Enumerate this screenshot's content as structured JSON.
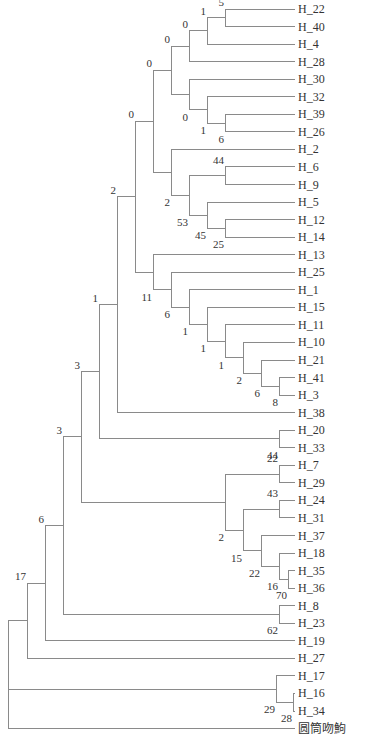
{
  "figure": {
    "type": "phylogenetic-tree",
    "layout": "rectangular-cladogram",
    "colors": {
      "branch": "#8a8a8a",
      "text": "#333333",
      "background": "#ffffff"
    },
    "geometry": {
      "leaf_x": 295,
      "label_x": 298,
      "first_leaf_y": 9,
      "leaf_spacing": 17.55
    }
  },
  "leaves": [
    "H_22",
    "H_40",
    "H_4",
    "H_28",
    "H_30",
    "H_32",
    "H_39",
    "H_26",
    "H_2",
    "H_6",
    "H_9",
    "H_5",
    "H_12",
    "H_14",
    "H_13",
    "H_25",
    "H_1",
    "H_15",
    "H_11",
    "H_10",
    "H_21",
    "H_41",
    "H_3",
    "H_38",
    "H_20",
    "H_33",
    "H_7",
    "H_29",
    "H_24",
    "H_31",
    "H_37",
    "H_18",
    "H_35",
    "H_36",
    "H_8",
    "H_23",
    "H_19",
    "H_27",
    "H_17",
    "H_16",
    "H_34",
    "圆筒吻鮈"
  ],
  "tree": {
    "x": 8,
    "support": "",
    "children": [
      {
        "x": 27,
        "support": "17",
        "children": [
          {
            "x": 45,
            "support": "6",
            "children": [
              {
                "x": 63,
                "support": "3",
                "children": [
                  {
                    "x": 81,
                    "support": "3",
                    "children": [
                      {
                        "x": 99,
                        "support": "1",
                        "children": [
                          {
                            "x": 117,
                            "support": "2",
                            "children": [
                              {
                                "x": 135,
                                "support": "0",
                                "children": [
                                  {
                                    "x": 153,
                                    "support": "0",
                                    "children": [
                                      {
                                        "x": 171,
                                        "support": "0",
                                        "children": [
                                          {
                                            "x": 189,
                                            "support": "0",
                                            "children": [
                                              {
                                                "x": 207,
                                                "support": "1",
                                                "children": [
                                                  {
                                                    "x": 225,
                                                    "support": "5",
                                                    "children": [
                                                      {
                                                        "leaf": "H_22"
                                                      },
                                                      {
                                                        "leaf": "H_40"
                                                      }
                                                    ]
                                                  },
                                                  {
                                                    "leaf": "H_4"
                                                  }
                                                ]
                                              },
                                              {
                                                "leaf": "H_28"
                                              }
                                            ]
                                          },
                                          {
                                            "x": 189,
                                            "support": "0",
                                            "label_below": true,
                                            "children": [
                                              {
                                                "leaf": "H_30"
                                              },
                                              {
                                                "x": 207,
                                                "support": "1",
                                                "label_below": true,
                                                "children": [
                                                  {
                                                    "leaf": "H_32"
                                                  },
                                                  {
                                                    "x": 225,
                                                    "support": "6",
                                                    "label_below": true,
                                                    "children": [
                                                      {
                                                        "leaf": "H_39"
                                                      },
                                                      {
                                                        "leaf": "H_26"
                                                      }
                                                    ]
                                                  }
                                                ]
                                              }
                                            ]
                                          }
                                        ]
                                      },
                                      {
                                        "x": 171,
                                        "support": "2",
                                        "label_below": true,
                                        "children": [
                                          {
                                            "leaf": "H_2"
                                          },
                                          {
                                            "x": 189,
                                            "support": "53",
                                            "label_below": true,
                                            "children": [
                                              {
                                                "x": 225,
                                                "support": "44",
                                                "children": [
                                                  {
                                                    "leaf": "H_6"
                                                  },
                                                  {
                                                    "leaf": "H_9"
                                                  }
                                                ]
                                              },
                                              {
                                                "x": 207,
                                                "support": "45",
                                                "label_below": true,
                                                "children": [
                                                  {
                                                    "leaf": "H_5"
                                                  },
                                                  {
                                                    "x": 225,
                                                    "support": "25",
                                                    "label_below": true,
                                                    "children": [
                                                      {
                                                        "leaf": "H_12"
                                                      },
                                                      {
                                                        "leaf": "H_14"
                                                      }
                                                    ]
                                                  }
                                                ]
                                              }
                                            ]
                                          }
                                        ]
                                      }
                                    ]
                                  },
                                  {
                                    "x": 153,
                                    "support": "11",
                                    "label_below": true,
                                    "children": [
                                      {
                                        "leaf": "H_13"
                                      },
                                      {
                                        "x": 171,
                                        "support": "6",
                                        "label_below": true,
                                        "children": [
                                          {
                                            "leaf": "H_25"
                                          },
                                          {
                                            "x": 189,
                                            "support": "1",
                                            "label_below": true,
                                            "children": [
                                              {
                                                "leaf": "H_1"
                                              },
                                              {
                                                "x": 207,
                                                "support": "1",
                                                "label_below": true,
                                                "children": [
                                                  {
                                                    "leaf": "H_15"
                                                  },
                                                  {
                                                    "x": 225,
                                                    "support": "1",
                                                    "label_below": true,
                                                    "children": [
                                                      {
                                                        "leaf": "H_11"
                                                      },
                                                      {
                                                        "x": 243,
                                                        "support": "2",
                                                        "label_below": true,
                                                        "children": [
                                                          {
                                                            "leaf": "H_10"
                                                          },
                                                          {
                                                            "x": 261,
                                                            "support": "6",
                                                            "label_below": true,
                                                            "children": [
                                                              {
                                                                "leaf": "H_21"
                                                              },
                                                              {
                                                                "x": 279,
                                                                "support": "8",
                                                                "label_below": true,
                                                                "children": [
                                                                  {
                                                                    "leaf": "H_41"
                                                                  },
                                                                  {
                                                                    "leaf": "H_3"
                                                                  }
                                                                ]
                                                              }
                                                            ]
                                                          }
                                                        ]
                                                      }
                                                    ]
                                                  }
                                                ]
                                              }
                                            ]
                                          }
                                        ]
                                      }
                                    ]
                                  }
                                ]
                              },
                              {
                                "leaf": "H_38"
                              }
                            ]
                          },
                          {
                            "x": 279,
                            "support": "44",
                            "label_below": true,
                            "children": [
                              {
                                "leaf": "H_20"
                              },
                              {
                                "leaf": "H_33"
                              }
                            ]
                          }
                        ]
                      },
                      {
                        "x": 225,
                        "support": "2",
                        "label_below": true,
                        "children": [
                          {
                            "x": 279,
                            "support": "22",
                            "children": [
                              {
                                "leaf": "H_7"
                              },
                              {
                                "leaf": "H_29"
                              }
                            ]
                          },
                          {
                            "x": 243,
                            "support": "15",
                            "label_below": true,
                            "children": [
                              {
                                "x": 279,
                                "support": "43",
                                "children": [
                                  {
                                    "leaf": "H_24"
                                  },
                                  {
                                    "leaf": "H_31"
                                  }
                                ]
                              },
                              {
                                "x": 261,
                                "support": "22",
                                "label_below": true,
                                "children": [
                                  {
                                    "leaf": "H_37"
                                  },
                                  {
                                    "x": 279,
                                    "support": "16",
                                    "label_below": true,
                                    "children": [
                                      {
                                        "leaf": "H_18"
                                      },
                                      {
                                        "x": 288,
                                        "support": "70",
                                        "label_below": true,
                                        "children": [
                                          {
                                            "leaf": "H_35"
                                          },
                                          {
                                            "leaf": "H_36"
                                          }
                                        ]
                                      }
                                    ]
                                  }
                                ]
                              }
                            ]
                          }
                        ]
                      }
                    ]
                  },
                  {
                    "x": 279,
                    "support": "62",
                    "label_below": true,
                    "children": [
                      {
                        "leaf": "H_8"
                      },
                      {
                        "leaf": "H_23"
                      }
                    ]
                  }
                ]
              },
              {
                "leaf": "H_19"
              }
            ]
          },
          {
            "leaf": "H_27"
          }
        ]
      },
      {
        "x": 27,
        "support": "",
        "skip": true,
        "children": [
          {
            "x": 276,
            "support": "29",
            "label_below": true,
            "children": [
              {
                "leaf": "H_17"
              },
              {
                "x": 293,
                "support": "28",
                "label_below": true,
                "children": [
                  {
                    "leaf": "H_16"
                  },
                  {
                    "leaf": "H_34"
                  }
                ]
              }
            ]
          }
        ]
      },
      {
        "leaf": "圆筒吻鮈"
      }
    ]
  }
}
